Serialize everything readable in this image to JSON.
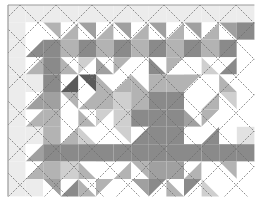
{
  "image": {
    "description": "Grayscale quilt pattern with triangle blocks and dashed diagonal quilting lines",
    "width": 263,
    "height": 205
  },
  "layout": {
    "origin_x": 8,
    "origin_y": 5,
    "cols": 14,
    "rows": 11,
    "cell_w": 17.6,
    "cell_h": 17.4
  },
  "palette": {
    "w": "#ffffff",
    "b": "#ececec",
    "s": "#e2e2e2",
    "l": "#cfcfcf",
    "m": "#b3b3b3",
    "g": "#a0a0a0",
    "d": "#8a8a8a",
    "k": "#5a5a5a",
    "border": "#9a9a9a",
    "stitch": "#6e6e6e"
  },
  "cells": [
    [
      "f b",
      "f b",
      "f b",
      "f b",
      "f b",
      "f b",
      "f b",
      "f b",
      "f b",
      "f b",
      "f b",
      "f b",
      "f b",
      "f b"
    ],
    [
      "f b",
      "f w",
      "tr m w",
      "tl w m",
      "tr g w",
      "tl w m",
      "tr g w",
      "tl w m",
      "tr g w",
      "tl w m",
      "tr g w",
      "tl w m",
      "tr g w",
      "f d"
    ],
    [
      "f b",
      "tl w d",
      "f d",
      "f m",
      "f d",
      "f m",
      "f d",
      "f m",
      "f d",
      "f m",
      "f d",
      "f m",
      "f d",
      "f w"
    ],
    [
      "f b",
      "tl w m",
      "f d",
      "tr w m",
      "tl l w",
      "tr w g",
      "tl m w",
      "f w",
      "tr w d",
      "tl m w",
      "f w",
      "tr w l",
      "tl w d",
      "f w"
    ],
    [
      "f b",
      "f b",
      "f d",
      "tl w k",
      "tr k w",
      "tr w m",
      "tl w m",
      "tr w m",
      "f m",
      "f m",
      "tl m w",
      "f w",
      "tr w m",
      "f w"
    ],
    [
      "f b",
      "tl w g",
      "f g",
      "tr m w",
      "tl w m",
      "f m",
      "f l",
      "f m",
      "f d",
      "f d",
      "f w",
      "tl w m",
      "tr l w",
      "f w"
    ],
    [
      "f b",
      "tl w m",
      "f m",
      "f w",
      "tr w m",
      "tl l w",
      "f l",
      "f d",
      "f d",
      "f d",
      "tr w g",
      "tl m w",
      "f w",
      "f w"
    ],
    [
      "f b",
      "f b",
      "f m",
      "tl w m",
      "tr w l",
      "f w",
      "tr l w",
      "tl w d",
      "f d",
      "f d",
      "f w",
      "tl w d",
      "f w",
      "f s"
    ],
    [
      "f b",
      "tl w g",
      "f d",
      "f d",
      "f d",
      "f d",
      "f d",
      "f d",
      "f d",
      "f d",
      "f d",
      "f d",
      "f d",
      "f d"
    ],
    [
      "f b",
      "tl w m",
      "f m",
      "f l",
      "tr w m",
      "f w",
      "tl w m",
      "tr m w",
      "f g",
      "f g",
      "tl w m",
      "f w",
      "tr m w",
      "f w"
    ],
    [
      "f b",
      "f b",
      "tr g w",
      "tl w d",
      "tr w m",
      "tl m w",
      "f w",
      "tr g w",
      "tl d w",
      "tr w m",
      "tl d w",
      "tr w l",
      "f w",
      "f w"
    ]
  ],
  "stitch_lines": {
    "spacing": 36,
    "offset": 12,
    "dash": "2,1.5"
  }
}
